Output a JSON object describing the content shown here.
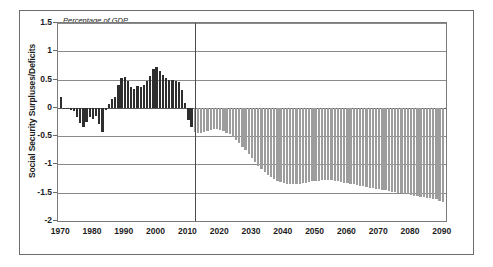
{
  "chart_data": {
    "type": "bar",
    "title": "",
    "subtitle": "Percentage of GDP",
    "xlabel": "",
    "ylabel": "Social Security Surpluses/Deficits",
    "ylim": [
      -2,
      1.5
    ],
    "xlim": [
      1969,
      2091
    ],
    "ytick_labels": [
      "1.5",
      "1",
      "0.5",
      "0",
      "-0.5",
      "-1",
      "-1.5",
      "-2"
    ],
    "ytick_values": [
      1.5,
      1,
      0.5,
      0,
      -0.5,
      -1,
      -1.5,
      -2
    ],
    "xtick_labels": [
      "1970",
      "1980",
      "1990",
      "2000",
      "2010",
      "2020",
      "2030",
      "2040",
      "2050",
      "2060",
      "2070",
      "2080",
      "2090"
    ],
    "xtick_values": [
      1970,
      1980,
      1990,
      2000,
      2010,
      2020,
      2030,
      2040,
      2050,
      2060,
      2070,
      2080,
      2090
    ],
    "grid": "horizontal",
    "legend": "none",
    "annotations": [
      {
        "name": "actual",
        "text": "Actual",
        "x": 2006
      },
      {
        "name": "projected",
        "text": "Projected",
        "x": 2014
      },
      {
        "name": "units",
        "text": "Percentage of GDP",
        "x": 1971
      }
    ],
    "divider_x": 2012,
    "colors": {
      "actual_bar": "#2e2e2e",
      "projected_bar": "#9d9d9d",
      "gridline": "#8a8a8a",
      "axis": "#7a7a7a",
      "text": "#1c1c1c",
      "background": "#ffffff"
    },
    "series": [
      {
        "name": "Actual",
        "style": "actual",
        "x": [
          1970,
          1971,
          1972,
          1973,
          1974,
          1975,
          1976,
          1977,
          1978,
          1979,
          1980,
          1981,
          1982,
          1983,
          1984,
          1985,
          1986,
          1987,
          1988,
          1989,
          1990,
          1991,
          1992,
          1993,
          1994,
          1995,
          1996,
          1997,
          1998,
          1999,
          2000,
          2001,
          2002,
          2003,
          2004,
          2005,
          2006,
          2007,
          2008,
          2009,
          2010,
          2011
        ],
        "values": [
          0.19,
          0.0,
          -0.02,
          -0.03,
          -0.06,
          -0.16,
          -0.26,
          -0.33,
          -0.25,
          -0.17,
          -0.2,
          -0.14,
          -0.28,
          -0.42,
          -0.04,
          0.06,
          0.16,
          0.2,
          0.4,
          0.52,
          0.54,
          0.47,
          0.37,
          0.33,
          0.39,
          0.36,
          0.41,
          0.47,
          0.57,
          0.68,
          0.73,
          0.66,
          0.58,
          0.53,
          0.49,
          0.5,
          0.48,
          0.45,
          0.31,
          0.09,
          -0.22,
          -0.33
        ]
      },
      {
        "name": "Projected",
        "style": "projected",
        "x": [
          2012,
          2013,
          2014,
          2015,
          2016,
          2017,
          2018,
          2019,
          2020,
          2021,
          2022,
          2023,
          2024,
          2025,
          2026,
          2027,
          2028,
          2029,
          2030,
          2031,
          2032,
          2033,
          2034,
          2035,
          2036,
          2037,
          2038,
          2039,
          2040,
          2041,
          2042,
          2043,
          2044,
          2045,
          2046,
          2047,
          2048,
          2049,
          2050,
          2051,
          2052,
          2053,
          2054,
          2055,
          2056,
          2057,
          2058,
          2059,
          2060,
          2061,
          2062,
          2063,
          2064,
          2065,
          2066,
          2067,
          2068,
          2069,
          2070,
          2071,
          2072,
          2073,
          2074,
          2075,
          2076,
          2077,
          2078,
          2079,
          2080,
          2081,
          2082,
          2083,
          2084,
          2085,
          2086,
          2087,
          2088,
          2089,
          2090
        ],
        "values": [
          -0.43,
          -0.44,
          -0.44,
          -0.43,
          -0.41,
          -0.39,
          -0.38,
          -0.38,
          -0.39,
          -0.41,
          -0.44,
          -0.47,
          -0.52,
          -0.57,
          -0.63,
          -0.69,
          -0.75,
          -0.82,
          -0.89,
          -0.96,
          -1.02,
          -1.08,
          -1.13,
          -1.18,
          -1.22,
          -1.26,
          -1.29,
          -1.31,
          -1.33,
          -1.34,
          -1.35,
          -1.35,
          -1.35,
          -1.34,
          -1.33,
          -1.32,
          -1.31,
          -1.3,
          -1.29,
          -1.29,
          -1.28,
          -1.28,
          -1.28,
          -1.28,
          -1.29,
          -1.3,
          -1.31,
          -1.32,
          -1.33,
          -1.34,
          -1.35,
          -1.36,
          -1.38,
          -1.39,
          -1.4,
          -1.41,
          -1.42,
          -1.43,
          -1.44,
          -1.45,
          -1.46,
          -1.47,
          -1.48,
          -1.49,
          -1.5,
          -1.51,
          -1.52,
          -1.53,
          -1.54,
          -1.55,
          -1.56,
          -1.57,
          -1.58,
          -1.59,
          -1.6,
          -1.61,
          -1.62,
          -1.64,
          -1.66
        ]
      }
    ]
  }
}
